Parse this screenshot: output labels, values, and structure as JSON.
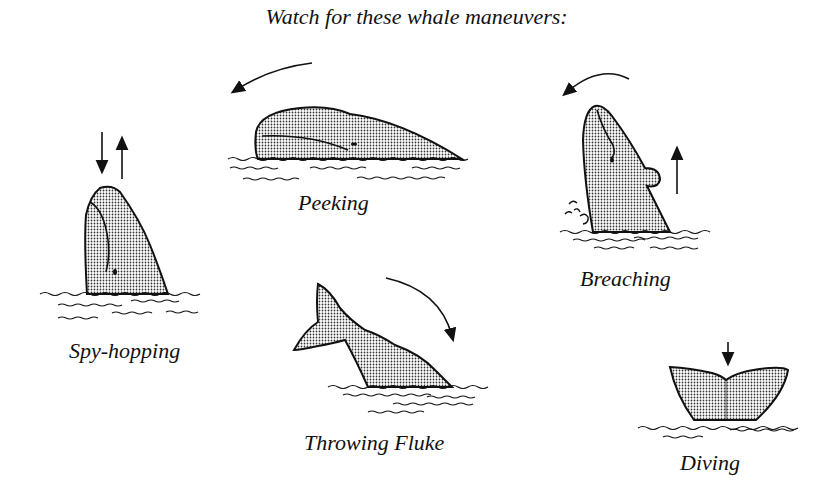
{
  "title": "Watch for these whale maneuvers:",
  "maneuvers": [
    {
      "id": "peeking",
      "label": "Peeking",
      "arrow": "curved-left"
    },
    {
      "id": "breaching",
      "label": "Breaching",
      "arrow": "curved-left-and-up"
    },
    {
      "id": "spy-hopping",
      "label": "Spy-hopping",
      "arrow": "down-and-up"
    },
    {
      "id": "throwing-fluke",
      "label": "Throwing Fluke",
      "arrow": "curved-down-right"
    },
    {
      "id": "diving",
      "label": "Diving",
      "arrow": "down"
    }
  ],
  "colors": {
    "ink": "#111111",
    "fill": "#c9c9c9",
    "background": "#ffffff"
  }
}
